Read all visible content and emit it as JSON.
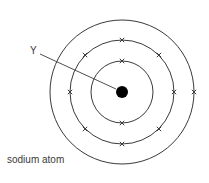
{
  "diagram": {
    "caption": "sodium atom",
    "label": "Y",
    "center": [
      122,
      92
    ],
    "nucleus_radius": 6,
    "shell_radii": [
      31,
      52,
      72
    ],
    "stroke_color": "#3a3a3a",
    "nucleus_color": "#000000",
    "electrons": [
      [
        122,
        61
      ],
      [
        122,
        123
      ],
      [
        122,
        40
      ],
      [
        159,
        55
      ],
      [
        174,
        92
      ],
      [
        159,
        129
      ],
      [
        122,
        144
      ],
      [
        85,
        129
      ],
      [
        70,
        92
      ],
      [
        85,
        55
      ],
      [
        194,
        92
      ]
    ],
    "pointer_line": [
      40,
      54,
      116,
      89
    ],
    "electron_configuration": "2,8,1"
  }
}
